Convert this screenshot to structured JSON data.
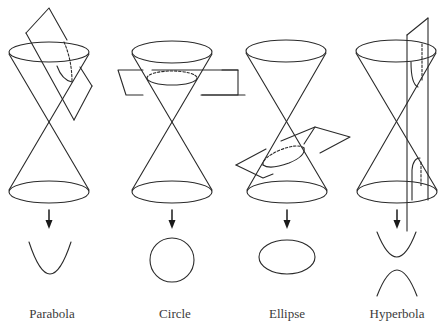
{
  "figure": {
    "line_color": "#2a2a2a",
    "background": "#ffffff",
    "panels": [
      {
        "id": "parabola",
        "label": "Parabola",
        "center_x": 50,
        "result_shape": "parabola",
        "plane": "tilted parallel to cone side"
      },
      {
        "id": "circle",
        "label": "Circle",
        "center_x": 172,
        "result_shape": "circle",
        "plane": "horizontal"
      },
      {
        "id": "ellipse",
        "label": "Ellipse",
        "center_x": 287,
        "result_shape": "ellipse",
        "plane": "tilted"
      },
      {
        "id": "hyperbola",
        "label": "Hyperbola",
        "center_x": 397,
        "result_shape": "hyperbola (two branches)",
        "plane": "vertical"
      }
    ]
  }
}
